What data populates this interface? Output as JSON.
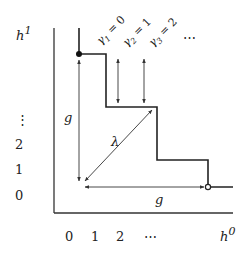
{
  "diagram": {
    "axes": {
      "y_label": "h",
      "y_label_sup": "1",
      "x_label": "h",
      "x_label_sup": "0",
      "y_ticks": [
        "0",
        "1",
        "2",
        "⋮"
      ],
      "x_ticks": [
        "0",
        "1",
        "2",
        "⋯"
      ]
    },
    "gamma_labels": [
      {
        "sym": "γ",
        "sub": "1",
        "eq": " = 0"
      },
      {
        "sym": "γ",
        "sub": "2",
        "eq": " = 1"
      },
      {
        "sym": "γ",
        "sub": "3",
        "eq": " = 2"
      }
    ],
    "gamma_ellipsis": "⋯",
    "labels": {
      "g_vertical": "g",
      "g_horizontal": "g",
      "lambda": "λ"
    },
    "colors": {
      "line": "#222222",
      "thin": "#333333"
    }
  }
}
